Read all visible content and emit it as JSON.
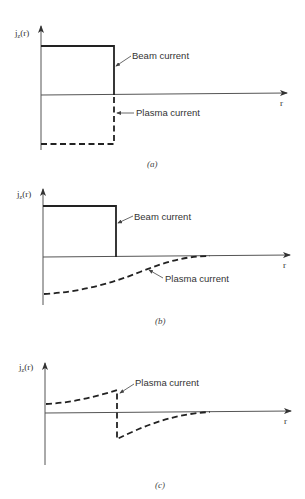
{
  "figure": {
    "panels": [
      {
        "id": "a",
        "caption": "(a)",
        "y_label": "j",
        "y_label_sub": "z",
        "y_label_arg": "(r)",
        "x_label": "r",
        "annotations": [
          "Beam current",
          "Plasma current"
        ]
      },
      {
        "id": "b",
        "caption": "(b)",
        "y_label": "j",
        "y_label_sub": "z",
        "y_label_arg": "(r)",
        "x_label": "r",
        "annotations": [
          "Beam current",
          "Plasma current"
        ]
      },
      {
        "id": "c",
        "caption": "(c)",
        "y_label": "j",
        "y_label_sub": "z",
        "y_label_arg": "(r)",
        "x_label": "r",
        "annotations": [
          "Plasma current"
        ]
      }
    ],
    "colors": {
      "line": "#222222",
      "axis": "#555555",
      "background": "#ffffff"
    }
  }
}
